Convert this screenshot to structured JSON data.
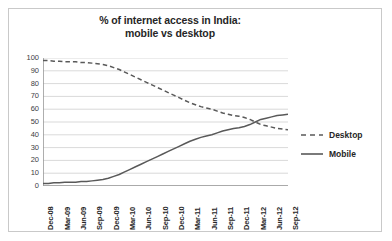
{
  "chart_data": {
    "type": "line",
    "title": "% of internet access in India: mobile vs desktop",
    "title_lines": [
      "% of internet access in India:",
      "mobile vs desktop"
    ],
    "xlabel": "",
    "ylabel": "",
    "ylim": [
      0,
      100
    ],
    "y_ticks": [
      100,
      90,
      80,
      70,
      60,
      50,
      40,
      30,
      20,
      10,
      0
    ],
    "grid": true,
    "legend_position": "right",
    "x_tick_labels": [
      "Dec-08",
      "Mar-09",
      "Jun-09",
      "Sep-09",
      "Dec-09",
      "Mar-10",
      "Jun-10",
      "Sep-10",
      "Dec-10",
      "Mar-11",
      "Jun-11",
      "Sep-11",
      "Dec-11",
      "Mar-12",
      "Jun-12",
      "Sep-12"
    ],
    "x": [
      "Dec-08",
      "Jan-09",
      "Feb-09",
      "Mar-09",
      "Apr-09",
      "May-09",
      "Jun-09",
      "Jul-09",
      "Aug-09",
      "Sep-09",
      "Oct-09",
      "Nov-09",
      "Dec-09",
      "Jan-10",
      "Feb-10",
      "Mar-10",
      "Apr-10",
      "May-10",
      "Jun-10",
      "Jul-10",
      "Aug-10",
      "Sep-10",
      "Oct-10",
      "Nov-10",
      "Dec-10",
      "Jan-11",
      "Feb-11",
      "Mar-11",
      "Apr-11",
      "May-11",
      "Jun-11",
      "Jul-11",
      "Aug-11",
      "Sep-11",
      "Oct-11",
      "Nov-11",
      "Dec-11",
      "Jan-12",
      "Feb-12",
      "Mar-12",
      "Apr-12",
      "May-12",
      "Jun-12",
      "Jul-12",
      "Aug-12",
      "Sep-12"
    ],
    "series": [
      {
        "name": "Desktop",
        "style": "dashed",
        "color": "#595959",
        "values": [
          98,
          98,
          97.5,
          97.5,
          97,
          97,
          97,
          96.5,
          96.5,
          96,
          95.5,
          95,
          94,
          92.5,
          91,
          89,
          87,
          85,
          83,
          81,
          79,
          77,
          75,
          73,
          71,
          69,
          67,
          65,
          63.5,
          62,
          61,
          60,
          58.5,
          57,
          56,
          55,
          54.5,
          53.5,
          52,
          50,
          48,
          47,
          46,
          45,
          44.5,
          44
        ]
      },
      {
        "name": "Mobile",
        "style": "solid",
        "color": "#595959",
        "values": [
          2,
          2,
          2.5,
          2.5,
          3,
          3,
          3,
          3.5,
          3.5,
          4,
          4.5,
          5,
          6,
          7.5,
          9,
          11,
          13,
          15,
          17,
          19,
          21,
          23,
          25,
          27,
          29,
          31,
          33,
          35,
          36.5,
          38,
          39,
          40,
          41.5,
          43,
          44,
          45,
          45.5,
          46.5,
          48,
          50,
          52,
          53,
          54,
          55,
          55.5,
          56
        ]
      }
    ]
  },
  "legend": {
    "entries": [
      {
        "label": "Desktop",
        "style": "dashed"
      },
      {
        "label": "Mobile",
        "style": "solid"
      }
    ]
  }
}
